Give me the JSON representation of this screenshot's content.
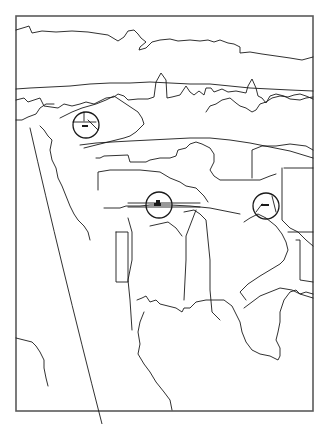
{
  "image": {
    "kind": "line-drawing",
    "subject": "town landscape with church towers, trees and rooftops",
    "width": 327,
    "height": 424,
    "background_color": "#ffffff",
    "line_color": "#1a1a1a",
    "frame_color": "#5a5a5a",
    "frame": {
      "x": 16,
      "y": 16,
      "width": 297,
      "height": 395
    }
  },
  "markers": [
    {
      "id": "marker-1",
      "label": "circled detail 1",
      "cx": 86,
      "cy": 125,
      "r": 13
    },
    {
      "id": "marker-2",
      "label": "circled detail 2",
      "cx": 159,
      "cy": 205,
      "r": 13
    },
    {
      "id": "marker-3",
      "label": "circled detail 3",
      "cx": 266,
      "cy": 206,
      "r": 13
    }
  ],
  "paths": {
    "sky_cloud": "M16 30 L26 27 L29 26 L32 33 L42 31 L56 32 L72 31 L88 32 L108 35 L118 41 L124 37 L128 31 L134 30 L138 34 L141 38 L146 42 L140 47 L139 50 L146 48 L152 42 L160 40 L170 39 L178 41 L190 40 L200 41 L208 40 L214 42 L220 40 L228 43 L234 44 L240 47 L240 53 L250 52 L262 54 L276 56 L290 58 L302 60 L313 57",
    "horizon": "M16 89 L30 88 L50 87 L70 86 L90 84 L110 83 L130 83 L150 82 L170 83 L190 84 L210 84 L230 86 L250 88 L270 89 L290 90 L313 91",
    "skyline": "M16 100 L24 98 L28 102 L34 100 L40 98 L44 106 L58 108 L64 104 L72 106 L80 104 L86 102 L94 104 L100 101 L106 98 L114 97 L118 94 L124 96 L128 100 L138 99 L148 99 L154 97 L156 82 L161 73 L166 80 L167 98 L172 97 L180 95 L186 86 L190 92 L194 95 L199 91 L204 95 L206 88 L211 88 L214 92 L222 89 L228 92 L236 91 L246 93 L248 86 L252 79 L256 88 L258 96 L262 98 L266 103 L270 96 L276 94 L284 96 L290 99 L300 100 L306 98 L313 97",
    "tree_right": "M206 112 L210 106 L216 104 L222 100 L230 98 L236 103 L240 106 L246 108 L252 112 L256 110 L260 104 L266 102 L272 98 L280 96 L288 97 L294 95 L300 94 L306 96 L313 99",
    "hill_left": "M16 120 L22 120 L28 117 L36 114 L40 108 L46 104 L54 104",
    "roofs_mid": "M60 118 L72 112 L82 108 L96 104 L106 100 L114 96 L120 100 L126 104 L132 108 L138 112 L142 118 L144 124 L140 128 L136 132 L130 136 L124 138 L116 140 L108 142 L100 144 L92 146 L84 148",
    "street_band": "M80 145 L96 143 L112 142 L130 141 L150 140 L170 139 L190 138 L210 138 L230 140 L250 143 L270 147 L290 151 L313 158",
    "mid_left": "M40 126 L44 130 L48 136 L52 140 L50 150 L52 160 L56 168 L58 178 L62 186 L66 196 L70 206 L74 214 L78 220 L84 226 L88 232 L90 240",
    "arc_left": "M30 128 Q60 260 102 424",
    "house_center_row": "M96 158 L100 158 L104 156 L128 155 L130 162 L146 162 L150 160 L160 158 L170 158 L176 156 L178 150 L186 148 L190 144 L196 142 L202 144 L210 148 L214 154 L214 162 L210 170 L214 176 L220 180 L240 180 L260 180 L270 176 L276 174",
    "house_center_left": "M98 190 L98 172 L110 170 L140 170 L160 172 L170 178 L180 182 L186 186 L196 188 L200 192 L204 196 L208 202",
    "house_center_wall": "M104 208 L120 208 L126 206 L140 206 L150 205 L170 205 L190 206 L210 208 L220 210 L240 214",
    "center_tower": "M184 212 L194 210 L200 214 L206 220 L208 240 L210 260 L210 290 L212 312 L220 320",
    "center_spire": "M196 210 L186 236 L186 260 L184 300",
    "center_house": "M128 218 L132 232 L132 260 L128 280 L130 300 L132 330",
    "center_house2": "M150 226 L168 222 L176 228 L182 236",
    "left_block": "M116 232 L128 232 L128 282 L116 282 L116 232",
    "right_tower_house": "M284 168 L300 168 L313 168 M282 168 L282 220 L290 228 L298 232 L306 240 L313 246",
    "right_house": "M252 178 L252 150 L262 146 L276 146 L290 144 L306 146 L313 150",
    "right_house2": "M244 222 L250 218 L258 214 L266 218 L276 226 L282 234 L286 242 L288 250 L284 260 L280 264 L270 270 L260 276 L248 284 L240 292 L246 300",
    "right_roof": "M244 308 L260 296 L270 292 L280 288 L292 290 L300 294 L313 298",
    "right_roof2": "M288 232 L300 232 L313 232 M296 240 L300 240 L300 280 L313 282",
    "bushes_bottom": "M137 300 L142 298 L146 296 L150 302 L156 300 L160 304 L168 306 L176 308 L182 312 L184 308 L190 308 L196 302 L206 300 L214 300 L224 300 L232 306 L236 314 L240 322 L242 332 L246 342 L252 350 L260 354 L270 356 L278 360 L280 356 L280 348 L276 340 L278 332 L280 322 L280 312 L284 300 L290 292 L296 290 L300 294 L306 292 L313 294",
    "bush_left_edge": "M144 312 L140 322 L138 332 L140 344 L138 354 L144 364 L150 372 L156 382 L164 392 L170 400 L172 410",
    "tree_left_bottom": "M16 338 L24 340 L32 342 L36 346 L40 352 L44 360 L44 368 L46 378 L48 386",
    "arc_bottom": "M102 424 L96 410"
  }
}
